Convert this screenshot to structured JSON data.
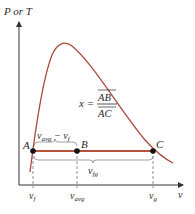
{
  "diagram": {
    "y_axis_label": "P or T",
    "x_axis_label": "v",
    "points": [
      {
        "name": "A",
        "label": "A"
      },
      {
        "name": "B",
        "label": "B"
      },
      {
        "name": "C",
        "label": "C"
      }
    ],
    "equation": {
      "lhs": "x =",
      "numerator": "AB",
      "denominator": "AC"
    },
    "brace_top_label": {
      "base": "v",
      "sub1": "avg",
      "minus": " − ",
      "base2": "v",
      "sub2": "f"
    },
    "brace_bottom_label": {
      "base": "v",
      "sub": "fg"
    },
    "x_ticks": [
      {
        "base": "v",
        "sub": "f"
      },
      {
        "base": "v",
        "sub": "avg"
      },
      {
        "base": "v",
        "sub": "g"
      }
    ],
    "colors": {
      "curve": "#a84a3a",
      "tie_line": "#b5523e",
      "axis": "#333333",
      "dashed": "#777777",
      "brace": "#8a8a8a",
      "point": "#111111"
    }
  }
}
